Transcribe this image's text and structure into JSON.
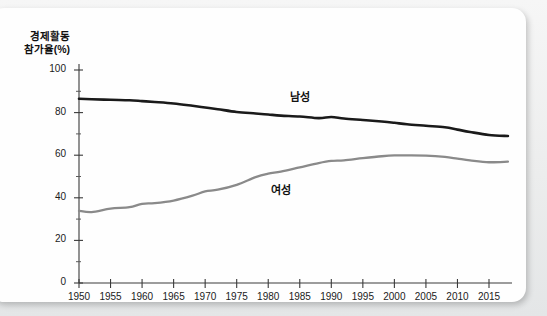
{
  "chart_data": {
    "type": "line",
    "title": "",
    "ylabel": "경제활동 참가율(%)",
    "ylabel_line1": "경제활동",
    "ylabel_line2": "참가율(%)",
    "xlabel": "",
    "ylim": [
      0,
      100
    ],
    "xlim": [
      1950,
      2018
    ],
    "ytick_labels": [
      "0",
      "20",
      "40",
      "60",
      "80",
      "100"
    ],
    "ytick_values": [
      0,
      20,
      40,
      60,
      80,
      100
    ],
    "yminor_step": 10,
    "xtick_labels": [
      "1950",
      "1955",
      "1960",
      "1965",
      "1970",
      "1975",
      "1980",
      "1985",
      "1990",
      "1995",
      "2000",
      "2005",
      "2010",
      "2015"
    ],
    "xtick_values": [
      1950,
      1955,
      1960,
      1965,
      1970,
      1975,
      1980,
      1985,
      1990,
      1995,
      2000,
      2005,
      2010,
      2015
    ],
    "grid": false,
    "legend_position": "inline-annotation",
    "series": [
      {
        "name": "남성",
        "color": "#1a1a1a",
        "label_x": 1985,
        "label_y": 88,
        "x": [
          1950,
          1952,
          1955,
          1958,
          1960,
          1962,
          1965,
          1968,
          1970,
          1972,
          1975,
          1978,
          1980,
          1982,
          1985,
          1988,
          1990,
          1992,
          1995,
          1998,
          2000,
          2002,
          2005,
          2008,
          2010,
          2012,
          2015,
          2018
        ],
        "values": [
          86.5,
          86.3,
          86.0,
          85.8,
          85.4,
          85.0,
          84.3,
          83.2,
          82.4,
          81.6,
          80.3,
          79.6,
          79.1,
          78.6,
          78.2,
          77.4,
          77.9,
          77.2,
          76.5,
          75.8,
          75.2,
          74.5,
          73.8,
          73.1,
          72.0,
          70.9,
          69.5,
          69.0
        ]
      },
      {
        "name": "여성",
        "color": "#8a8a8a",
        "label_x": 1982,
        "label_y": 44,
        "x": [
          1950,
          1952,
          1955,
          1958,
          1960,
          1962,
          1965,
          1968,
          1970,
          1972,
          1975,
          1978,
          1980,
          1982,
          1985,
          1988,
          1990,
          1992,
          1995,
          1998,
          2000,
          2002,
          2005,
          2008,
          2010,
          2012,
          2015,
          2018
        ],
        "values": [
          33.9,
          33.3,
          34.9,
          35.6,
          37.2,
          37.5,
          38.7,
          41.0,
          43.0,
          43.8,
          46.1,
          49.7,
          51.3,
          52.3,
          54.3,
          56.3,
          57.3,
          57.6,
          58.6,
          59.5,
          59.9,
          59.9,
          59.8,
          59.2,
          58.4,
          57.6,
          56.7,
          57.0
        ]
      }
    ]
  }
}
